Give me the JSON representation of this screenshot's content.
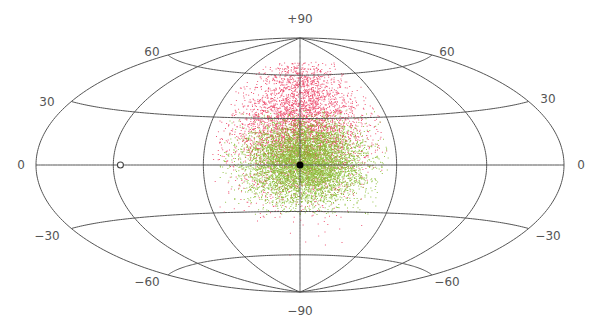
{
  "chart_data": {
    "type": "scatter",
    "projection": "hammer-aitoff (all-sky)",
    "title": "",
    "xlabel": "",
    "ylabel": "",
    "grid": true,
    "center_px": [
      300,
      165
    ],
    "semi_axes_px": [
      264,
      127
    ],
    "meridians_deg": [
      -180,
      -120,
      -60,
      0,
      60,
      120,
      180
    ],
    "parallels_deg": [
      -60,
      -30,
      0,
      30,
      60
    ],
    "latitude_labels": [
      {
        "text": "+90",
        "x": 300,
        "y": 23,
        "anchor": "middle"
      },
      {
        "text": "60",
        "x": 152,
        "y": 56,
        "anchor": "middle"
      },
      {
        "text": "60",
        "x": 447,
        "y": 56,
        "anchor": "middle"
      },
      {
        "text": "30",
        "x": 47,
        "y": 106,
        "anchor": "middle"
      },
      {
        "text": "30",
        "x": 548,
        "y": 103,
        "anchor": "middle"
      },
      {
        "text": "0",
        "x": 21,
        "y": 169,
        "anchor": "middle"
      },
      {
        "text": "0",
        "x": 581,
        "y": 169,
        "anchor": "middle"
      },
      {
        "text": "−30",
        "x": 47,
        "y": 240,
        "anchor": "middle"
      },
      {
        "text": "−30",
        "x": 548,
        "y": 240,
        "anchor": "middle"
      },
      {
        "text": "−60",
        "x": 147,
        "y": 286,
        "anchor": "middle"
      },
      {
        "text": "−60",
        "x": 447,
        "y": 286,
        "anchor": "middle"
      },
      {
        "text": "−90",
        "x": 300,
        "y": 315,
        "anchor": "middle"
      }
    ],
    "markers": [
      {
        "name": "center-dot",
        "lon": 0,
        "lat": 0,
        "style": "filled",
        "color": "#000000",
        "r": 3.5
      },
      {
        "name": "open-circle",
        "lon": -115,
        "lat": 0,
        "style": "open",
        "color": "#444444",
        "r": 3
      }
    ],
    "series": [
      {
        "name": "red population",
        "color": "#e8204a",
        "count": 4200,
        "distribution": {
          "lon_center": 0,
          "lat_center": 25,
          "lon_sigma": 22,
          "lat_sigma": 22,
          "lon_range": [
            -55,
            55
          ],
          "lat_range": [
            -60,
            70
          ]
        }
      },
      {
        "name": "green population",
        "color": "#7ab51d",
        "count": 6500,
        "distribution": {
          "lon_center": 3,
          "lat_center": 2,
          "lon_sigma": 18,
          "lat_sigma": 13,
          "lon_range": [
            -50,
            55
          ],
          "lat_range": [
            -32,
            36
          ]
        }
      }
    ],
    "grid_color": "#555555"
  }
}
